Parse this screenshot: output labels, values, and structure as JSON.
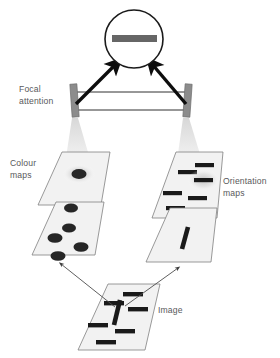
{
  "figure": {
    "background_color": "#ffffff"
  },
  "labels": {
    "focal_attention_line1": "Focal",
    "focal_attention_line2": "attention",
    "colour_maps_line1": "Colour",
    "colour_maps_line2": "maps",
    "orientation_maps_line1": "Orientation",
    "orientation_maps_line2": "maps",
    "image": "Image"
  },
  "colors": {
    "text": "#58595b",
    "plane_fill": "#f2f2f2",
    "plane_stroke": "#808080",
    "bar_dark": "#1a1a1a",
    "blob_dark": "#262626",
    "attention_bar": "#8c8c8c",
    "attention_bar_stroke": "#6e6e6e",
    "circle_stroke": "#1a1a1a",
    "circle_fill": "#ffffff",
    "percept_bar": "#666666",
    "beam": "#e8e8e8",
    "thin_arrow": "#4d4d4d"
  },
  "percept": {
    "shape": "circle",
    "center": [
      134,
      39
    ],
    "radius": 29,
    "content": "horizontal-bar",
    "bar": {
      "x": 112,
      "y": 35,
      "width": 45,
      "height": 7
    }
  },
  "attention_bars": [
    {
      "name": "left-attention-bar",
      "x": 71,
      "y": 84,
      "width": 7,
      "height": 33,
      "tilt_deg": -4
    },
    {
      "name": "right-attention-bar",
      "x": 184,
      "y": 84,
      "width": 7,
      "height": 33,
      "tilt_deg": 4
    }
  ],
  "connector_lines": [
    {
      "name": "upper-connector",
      "x1": 76,
      "y1": 92,
      "x2": 186,
      "y2": 92
    },
    {
      "name": "lower-connector",
      "x1": 74,
      "y1": 110,
      "x2": 188,
      "y2": 110
    }
  ],
  "thick_arrows": [
    {
      "name": "left-attention-arrow",
      "from": [
        76,
        104
      ],
      "to": [
        116,
        64
      ]
    },
    {
      "name": "right-attention-arrow",
      "from": [
        186,
        104
      ],
      "to": [
        152,
        64
      ]
    }
  ],
  "planes": [
    {
      "name": "colour-map-upper",
      "group": "colour",
      "points": "38,205 62,152 110,152 101,205",
      "items": [
        {
          "type": "blob",
          "cx": 79,
          "cy": 174,
          "rx": 7.5,
          "ry": 5,
          "glow": true
        }
      ]
    },
    {
      "name": "colour-map-lower",
      "group": "colour",
      "points": "32,255 56,202 104,202 95,255",
      "items": [
        {
          "type": "blob",
          "cx": 71,
          "cy": 208,
          "rx": 7,
          "ry": 4.6,
          "glow": false
        },
        {
          "type": "blob",
          "cx": 69,
          "cy": 228,
          "rx": 7,
          "ry": 4.6,
          "glow": false
        },
        {
          "type": "blob",
          "cx": 55,
          "cy": 238,
          "rx": 7.5,
          "ry": 4.8,
          "glow": false
        },
        {
          "type": "blob",
          "cx": 81,
          "cy": 247,
          "rx": 7.5,
          "ry": 4.8,
          "glow": false
        },
        {
          "type": "blob",
          "cx": 58,
          "cy": 256,
          "rx": 7.5,
          "ry": 4.8,
          "glow": false
        }
      ]
    },
    {
      "name": "orientation-map-upper",
      "group": "orientation",
      "points": "152,218 176,152 223,152 217,218",
      "items": [
        {
          "type": "bar",
          "x": 195,
          "y": 163,
          "w": 19,
          "h": 4.2,
          "glow": false
        },
        {
          "type": "bar",
          "x": 178,
          "y": 170,
          "w": 19,
          "h": 4.2,
          "glow": false
        },
        {
          "type": "bar",
          "x": 194,
          "y": 178,
          "w": 19,
          "h": 4.2,
          "glow": true
        },
        {
          "type": "bar",
          "x": 163,
          "y": 191,
          "w": 19,
          "h": 4.2,
          "glow": false
        },
        {
          "type": "bar",
          "x": 188,
          "y": 196,
          "w": 19,
          "h": 4.2,
          "glow": false
        },
        {
          "type": "bar",
          "x": 166,
          "y": 206,
          "w": 19,
          "h": 4.2,
          "glow": false
        }
      ]
    },
    {
      "name": "orientation-map-lower",
      "group": "orientation",
      "points": "146,262 170,208 217,208 211,262",
      "items": [
        {
          "type": "tilted-bar",
          "x1": 182,
          "y1": 249,
          "x2": 188,
          "y2": 227,
          "w": 4.6
        }
      ]
    },
    {
      "name": "image-plane",
      "group": "image",
      "points": "78,350 108,284 160,284 145,350",
      "items": [
        {
          "type": "bar",
          "x": 123,
          "y": 292,
          "w": 20,
          "h": 4.4
        },
        {
          "type": "bar",
          "x": 104,
          "y": 301,
          "w": 20,
          "h": 4.4
        },
        {
          "type": "bar",
          "x": 128,
          "y": 307,
          "w": 20,
          "h": 4.4
        },
        {
          "type": "bar",
          "x": 88,
          "y": 323,
          "w": 20,
          "h": 4.4
        },
        {
          "type": "bar",
          "x": 115,
          "y": 329,
          "w": 20,
          "h": 4.4
        },
        {
          "type": "bar",
          "x": 96,
          "y": 340,
          "w": 20,
          "h": 4.4
        },
        {
          "type": "tilted-bar",
          "x1": 114,
          "y1": 325,
          "x2": 120,
          "y2": 300,
          "w": 4.6
        }
      ]
    }
  ],
  "beams": [
    {
      "name": "left-attention-beam",
      "points": "72,118 78,118 101,197 60,197"
    },
    {
      "name": "right-attention-beam",
      "points": "183,118 189,118 213,197 172,197"
    }
  ],
  "thin_arrows": [
    {
      "name": "image-to-colour-arrow",
      "from": [
        115,
        307
      ],
      "to": [
        61,
        264
      ]
    },
    {
      "name": "image-to-orientation-arrow",
      "from": [
        125,
        306
      ],
      "to": [
        178,
        268
      ]
    }
  ]
}
